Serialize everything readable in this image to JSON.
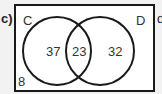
{
  "part_label": "c)",
  "next_label": "d",
  "venn": {
    "set_a_label": "C",
    "set_b_label": "D",
    "only_a": "37",
    "intersection": "23",
    "only_b": "32",
    "outside": "8"
  }
}
